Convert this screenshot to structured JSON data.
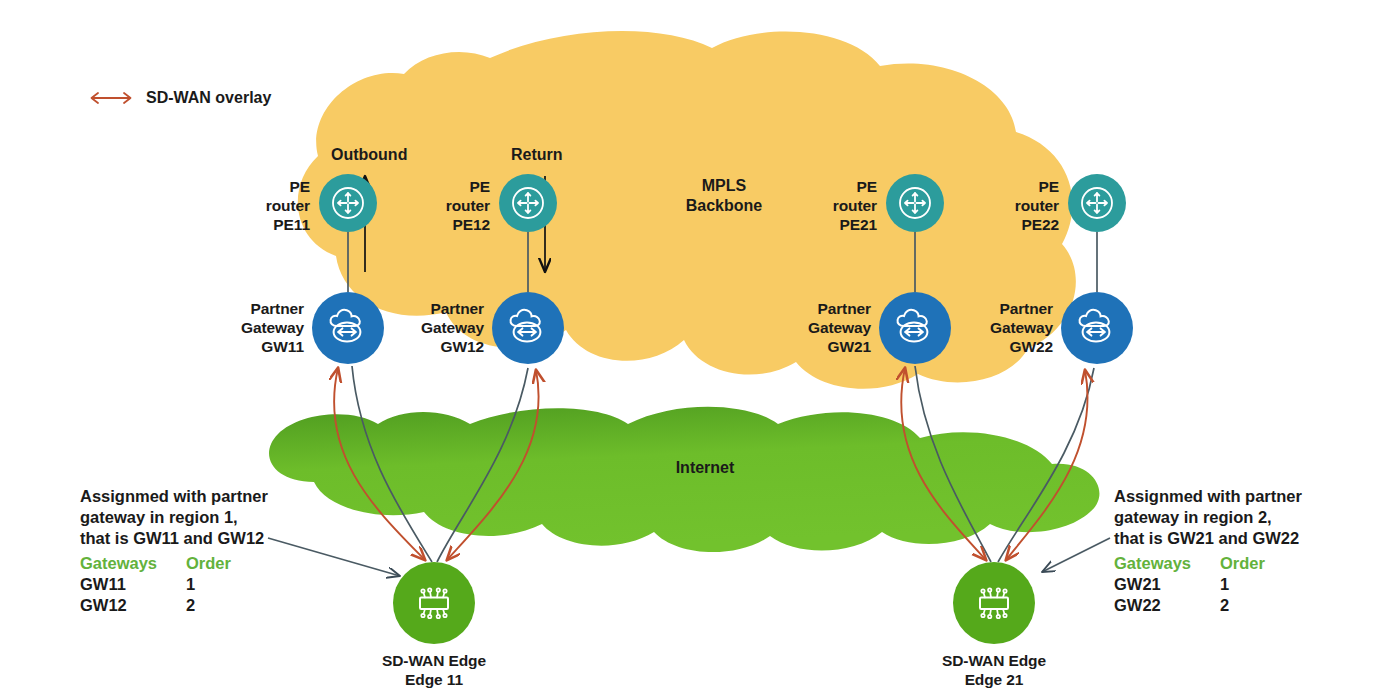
{
  "legend": {
    "icon": "double-arrow-icon",
    "label": "SD-WAN overlay",
    "color": "#C0502E"
  },
  "clouds": {
    "mpls": {
      "label": "MPLS\nBackbone",
      "color": "#F8CB64"
    },
    "internet": {
      "label": "Internet",
      "color": "#6FBE2B"
    }
  },
  "flows": [
    {
      "name": "outbound",
      "label": "Outbound",
      "direction": "up"
    },
    {
      "name": "return",
      "label": "Return",
      "direction": "down"
    }
  ],
  "nodes": {
    "pe_routers": [
      {
        "id": "PE11",
        "label": "PE\nrouter\nPE11",
        "icon": "router-icon",
        "color": "#2C9C9C"
      },
      {
        "id": "PE12",
        "label": "PE\nrouter\nPE12",
        "icon": "router-icon",
        "color": "#2C9C9C"
      },
      {
        "id": "PE21",
        "label": "PE\nrouter\nPE21",
        "icon": "router-icon",
        "color": "#2C9C9C"
      },
      {
        "id": "PE22",
        "label": "PE\nrouter\nPE22",
        "icon": "router-icon",
        "color": "#2C9C9C"
      }
    ],
    "gateways": [
      {
        "id": "GW11",
        "label": "Partner\nGateway\nGW11",
        "icon": "cloud-gateway-icon",
        "color": "#1F72B8"
      },
      {
        "id": "GW12",
        "label": "Partner\nGateway\nGW12",
        "icon": "cloud-gateway-icon",
        "color": "#1F72B8"
      },
      {
        "id": "GW21",
        "label": "Partner\nGateway\nGW21",
        "icon": "cloud-gateway-icon",
        "color": "#1F72B8"
      },
      {
        "id": "GW22",
        "label": "Partner\nGateway\nGW22",
        "icon": "cloud-gateway-icon",
        "color": "#1F72B8"
      }
    ],
    "edges": [
      {
        "id": "Edge11",
        "label": "SD-WAN Edge\nEdge 11",
        "icon": "sdwan-edge-chip-icon",
        "color": "#55A91B"
      },
      {
        "id": "Edge21",
        "label": "SD-WAN Edge\nEdge 21",
        "icon": "sdwan-edge-chip-icon",
        "color": "#55A91B"
      }
    ]
  },
  "annotations": [
    {
      "name": "region-1-annotation",
      "text": "Assignmed with partner\ngateway in region 1,\nthat is GW11 and GW12",
      "table": {
        "headers": [
          "Gateways",
          "Order"
        ],
        "header_color": "#63B23C",
        "rows": [
          [
            "GW11",
            "1"
          ],
          [
            "GW12",
            "2"
          ]
        ]
      }
    },
    {
      "name": "region-2-annotation",
      "text": "Assignmed with partner\ngateway in region 2,\nthat is GW21 and GW22",
      "table": {
        "headers": [
          "Gateways",
          "Order"
        ],
        "header_color": "#63B23C",
        "rows": [
          [
            "GW21",
            "1"
          ],
          [
            "GW22",
            "2"
          ]
        ]
      }
    }
  ]
}
